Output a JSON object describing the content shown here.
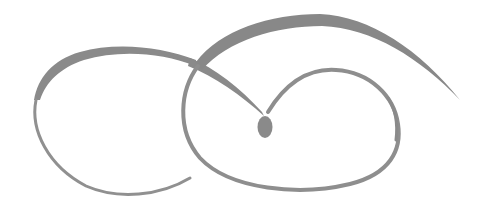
{
  "ornament": {
    "description": "Decorative calligraphic flourish with two interlocking loops and a teardrop accent",
    "colors": {
      "background": "#ffffff",
      "ink": "#8c8c8c",
      "ink_dark": "#7a7a7a"
    }
  }
}
